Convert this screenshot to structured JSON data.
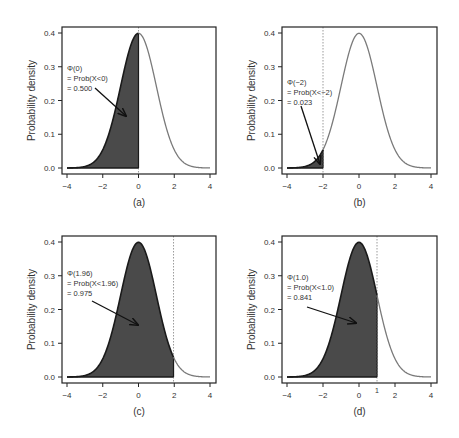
{
  "colors": {
    "fill": "#4a4a4a",
    "curve_shaded": "#1a1a1a",
    "curve_unshaded": "#7a7a7a",
    "axis": "#222222",
    "dotted_line": "#9a9a9a",
    "text": "#333333"
  },
  "chart_data": [
    {
      "type": "area",
      "panel_label": "(a)",
      "title": "",
      "xlabel": "",
      "ylabel": "Probability density",
      "xlim": [
        -4,
        4
      ],
      "ylim": [
        0,
        0.4
      ],
      "xticks": [
        "-4",
        "-2",
        "0",
        "2",
        "4"
      ],
      "yticks": [
        "0.0",
        "0.1",
        "0.2",
        "0.3",
        "0.4"
      ],
      "distribution": "standard normal N(0,1)",
      "shade_upper_limit": 0,
      "annotation": [
        "Φ(0)",
        "= Prob(X<0)",
        "= 0.500"
      ],
      "probability": 0.5,
      "extra_tick": null
    },
    {
      "type": "area",
      "panel_label": "(b)",
      "title": "",
      "xlabel": "",
      "ylabel": "Probability density",
      "xlim": [
        -4,
        4
      ],
      "ylim": [
        0,
        0.4
      ],
      "xticks": [
        "-4",
        "-2",
        "0",
        "2",
        "4"
      ],
      "yticks": [
        "0.0",
        "0.1",
        "0.2",
        "0.3",
        "0.4"
      ],
      "distribution": "standard normal N(0,1)",
      "shade_upper_limit": -2,
      "annotation": [
        "Φ(−2)",
        "= Prob(X<−2)",
        "= 0.023"
      ],
      "probability": 0.023,
      "extra_tick": null
    },
    {
      "type": "area",
      "panel_label": "(c)",
      "title": "",
      "xlabel": "",
      "ylabel": "Probability density",
      "xlim": [
        -4,
        4
      ],
      "ylim": [
        0,
        0.4
      ],
      "xticks": [
        "-4",
        "-2",
        "0",
        "2",
        "4"
      ],
      "yticks": [
        "0.0",
        "0.1",
        "0.2",
        "0.3",
        "0.4"
      ],
      "distribution": "standard normal N(0,1)",
      "shade_upper_limit": 1.96,
      "annotation": [
        "Φ(1.96)",
        "= Prob(X<1.96)",
        "= 0.975"
      ],
      "probability": 0.975,
      "extra_tick": null
    },
    {
      "type": "area",
      "panel_label": "(d)",
      "title": "",
      "xlabel": "",
      "ylabel": "Probability density",
      "xlim": [
        -4,
        4
      ],
      "ylim": [
        0,
        0.4
      ],
      "xticks": [
        "-4",
        "-2",
        "0",
        "2",
        "4"
      ],
      "yticks": [
        "0.0",
        "0.1",
        "0.2",
        "0.3",
        "0.4"
      ],
      "distribution": "standard normal N(0,1)",
      "shade_upper_limit": 1.0,
      "annotation": [
        "Φ(1.0)",
        "= Prob(X<1.0)",
        "= 0.841"
      ],
      "probability": 0.841,
      "extra_tick": "1"
    }
  ],
  "layout": {
    "panels": [
      {
        "box": [
          62,
          27,
          216,
          174
        ],
        "x0": 67,
        "x1": 210,
        "y0": 168,
        "y1": 33,
        "arrow": [
          [
            95,
            88
          ],
          [
            126,
            116
          ]
        ],
        "text_xy": [
          67,
          71
        ],
        "label_y": 206
      },
      {
        "box": [
          282,
          27,
          437,
          174
        ],
        "x0": 287,
        "x1": 431,
        "y0": 168,
        "y1": 33,
        "arrow": [
          [
            301,
            106
          ],
          [
            320,
            164
          ]
        ],
        "text_xy": [
          287,
          85
        ],
        "label_y": 206
      },
      {
        "box": [
          62,
          236,
          216,
          383
        ],
        "x0": 67,
        "x1": 210,
        "y0": 377,
        "y1": 242,
        "arrow": [
          [
            92,
            301
          ],
          [
            138,
            325
          ]
        ],
        "text_xy": [
          67,
          276
        ],
        "label_y": 415
      },
      {
        "box": [
          282,
          236,
          437,
          383
        ],
        "x0": 287,
        "x1": 431,
        "y0": 377,
        "y1": 242,
        "arrow": [
          [
            307,
            307
          ],
          [
            356,
            323
          ]
        ],
        "text_xy": [
          287,
          280
        ],
        "label_y": 415
      }
    ]
  }
}
